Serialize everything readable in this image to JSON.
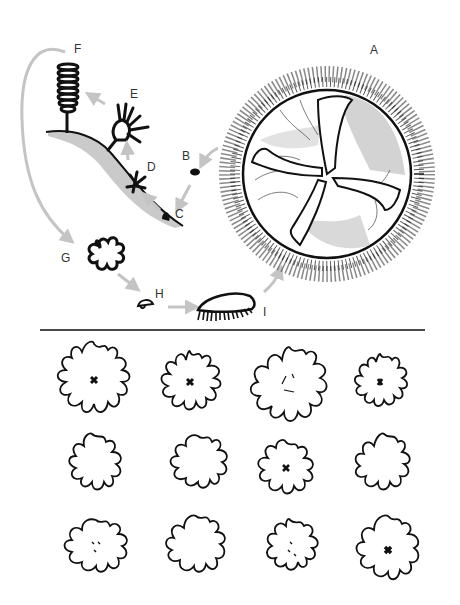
{
  "figure": {
    "colors": {
      "ink": "#111111",
      "arrow": "#c4c4c4",
      "shade": "#bdbdbd",
      "label": "#333333",
      "divider": "#4a4a4a"
    },
    "life_cycle": {
      "stages": [
        {
          "id": "A",
          "label": "A",
          "description": "adult medusa"
        },
        {
          "id": "B",
          "label": "B",
          "description": "planula larva"
        },
        {
          "id": "C",
          "label": "C",
          "description": "settled planula"
        },
        {
          "id": "D",
          "label": "D",
          "description": "young polyp"
        },
        {
          "id": "E",
          "label": "E",
          "description": "scyphistoma polyp"
        },
        {
          "id": "F",
          "label": "F",
          "description": "strobila"
        },
        {
          "id": "G",
          "label": "G",
          "description": "ephyra"
        },
        {
          "id": "H",
          "label": "H",
          "description": "juvenile"
        },
        {
          "id": "I",
          "label": "I",
          "description": "young medusa"
        }
      ],
      "sequence": [
        "A",
        "B",
        "C",
        "D",
        "E",
        "F",
        "G",
        "H",
        "I",
        "A"
      ]
    },
    "variants_grid": {
      "rows": 3,
      "columns": 4,
      "count": 12
    }
  }
}
